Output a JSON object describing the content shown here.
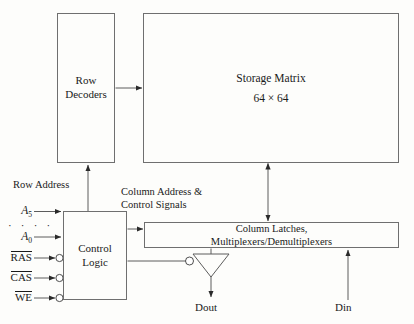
{
  "diagram": {
    "background_color": "#fdfdfb",
    "line_color": "#6f6f6f",
    "text_color": "#1a1a1a"
  },
  "blocks": {
    "row_decoders": {
      "line1": "Row",
      "line2": "Decoders"
    },
    "storage_matrix": {
      "line1": "Storage Matrix",
      "line2": "64 × 64"
    },
    "control_logic": {
      "line1": "Control",
      "line2": "Logic"
    },
    "column_latches": {
      "line1": "Column Latches,",
      "line2": "Multiplexers/Demultiplexers"
    }
  },
  "labels": {
    "row_address": "Row Address",
    "column_address_line1": "Column Address &",
    "column_address_line2": "Control Signals",
    "dout": "Dout",
    "din": "Din",
    "address_ellipsis": "· · · ·"
  },
  "signals": [
    {
      "name": "A5",
      "base": "A",
      "subscript": "5",
      "overline": false,
      "bubble": false,
      "italic": true
    },
    {
      "name": "A0",
      "base": "A",
      "subscript": "0",
      "overline": false,
      "bubble": false,
      "italic": true
    },
    {
      "name": "RAS",
      "base": "RAS",
      "subscript": "",
      "overline": true,
      "bubble": true,
      "italic": false
    },
    {
      "name": "CAS",
      "base": "CAS",
      "subscript": "",
      "overline": true,
      "bubble": true,
      "italic": false
    },
    {
      "name": "WE",
      "base": "WE",
      "subscript": "",
      "overline": true,
      "bubble": true,
      "italic": false
    }
  ],
  "components": {
    "tristate_buffer": "tri-state output buffer with active-low enable"
  }
}
